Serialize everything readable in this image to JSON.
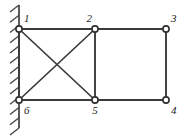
{
  "diagram": {
    "background_color": "#ffffff",
    "line_color": "#3a3a3a",
    "support_color": "#4a4a4a",
    "node_fill_color": "#ffffff",
    "label_color": "#1a1a1a",
    "canvas": {
      "width": 191,
      "height": 140
    },
    "support": {
      "type": "fixed-wall",
      "name": "left-wall-support",
      "x": 19,
      "y_top": 5,
      "y_bottom": 128,
      "hatch_count": 13,
      "hatch_length": 9,
      "hatch_dx": -9,
      "hatch_dy": 7,
      "attached_nodes": [
        "1",
        "6"
      ]
    },
    "nodes": [
      {
        "id": "1",
        "label": "1",
        "x": 19,
        "y": 29,
        "r": 3.1,
        "label_x": 24,
        "label_y": 22,
        "label_anchor": "start"
      },
      {
        "id": "2",
        "label": "2",
        "x": 95,
        "y": 29,
        "r": 3.1,
        "label_x": 92,
        "label_y": 22,
        "label_anchor": "end"
      },
      {
        "id": "3",
        "label": "3",
        "x": 166,
        "y": 29,
        "r": 3.1,
        "label_x": 171,
        "label_y": 22,
        "label_anchor": "start"
      },
      {
        "id": "4",
        "label": "4",
        "x": 166,
        "y": 100,
        "r": 3.1,
        "label_x": 171,
        "label_y": 114,
        "label_anchor": "start"
      },
      {
        "id": "5",
        "label": "5",
        "x": 95,
        "y": 100,
        "r": 3.1,
        "label_x": 95,
        "label_y": 114,
        "label_anchor": "middle"
      },
      {
        "id": "6",
        "label": "6",
        "x": 19,
        "y": 100,
        "r": 3.1,
        "label_x": 24,
        "label_y": 114,
        "label_anchor": "start"
      }
    ],
    "members": [
      {
        "id": "m12",
        "from": "1",
        "to": "2",
        "kind": "chord",
        "x1": 19,
        "y1": 29,
        "x2": 95,
        "y2": 29
      },
      {
        "id": "m23",
        "from": "2",
        "to": "3",
        "kind": "chord",
        "x1": 95,
        "y1": 29,
        "x2": 166,
        "y2": 29
      },
      {
        "id": "m34",
        "from": "3",
        "to": "4",
        "kind": "chord",
        "x1": 166,
        "y1": 29,
        "x2": 166,
        "y2": 100
      },
      {
        "id": "m45",
        "from": "4",
        "to": "5",
        "kind": "chord",
        "x1": 166,
        "y1": 100,
        "x2": 95,
        "y2": 100
      },
      {
        "id": "m56",
        "from": "5",
        "to": "6",
        "kind": "chord",
        "x1": 95,
        "y1": 100,
        "x2": 19,
        "y2": 100
      },
      {
        "id": "m61",
        "from": "6",
        "to": "1",
        "kind": "chord",
        "x1": 19,
        "y1": 100,
        "x2": 19,
        "y2": 29
      },
      {
        "id": "m25",
        "from": "2",
        "to": "5",
        "kind": "chord",
        "x1": 95,
        "y1": 29,
        "x2": 95,
        "y2": 100
      },
      {
        "id": "m15",
        "from": "1",
        "to": "5",
        "kind": "diagonal",
        "x1": 19,
        "y1": 29,
        "x2": 95,
        "y2": 100
      },
      {
        "id": "m26",
        "from": "2",
        "to": "6",
        "kind": "diagonal",
        "x1": 95,
        "y1": 29,
        "x2": 19,
        "y2": 100
      }
    ]
  }
}
